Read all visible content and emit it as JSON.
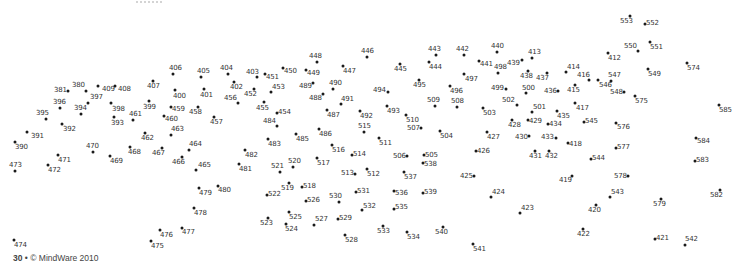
{
  "page": {
    "type": "dot-to-dot puzzle",
    "footer": {
      "page_number": "30",
      "separator": "•",
      "copyright": "© MindWare 2010"
    }
  },
  "style": {
    "dot_color": "#1a1a1a",
    "label_color": "#333333",
    "background": "#ffffff"
  },
  "dots": [
    {
      "n": "381",
      "x": 68,
      "y": 91,
      "lx": -14,
      "ly": -4
    },
    {
      "n": "380",
      "x": 86,
      "y": 91,
      "lx": -14,
      "ly": -9
    },
    {
      "n": "409",
      "x": 98,
      "y": 86,
      "lx": 4,
      "ly": 0
    },
    {
      "n": "408",
      "x": 115,
      "y": 86,
      "lx": 3,
      "ly": 0
    },
    {
      "n": "397",
      "x": 88,
      "y": 103,
      "lx": 2,
      "ly": -9
    },
    {
      "n": "396",
      "x": 60,
      "y": 108,
      "lx": -7,
      "ly": -9
    },
    {
      "n": "394",
      "x": 81,
      "y": 114,
      "lx": -7,
      "ly": -9
    },
    {
      "n": "398",
      "x": 111,
      "y": 103,
      "lx": 1,
      "ly": 3
    },
    {
      "n": "395",
      "x": 46,
      "y": 119,
      "lx": -10,
      "ly": -9
    },
    {
      "n": "392",
      "x": 62,
      "y": 124,
      "lx": 1,
      "ly": 2
    },
    {
      "n": "393",
      "x": 114,
      "y": 117,
      "lx": -3,
      "ly": 3
    },
    {
      "n": "461",
      "x": 133,
      "y": 120,
      "lx": -4,
      "ly": -9
    },
    {
      "n": "391",
      "x": 27,
      "y": 132,
      "lx": 4,
      "ly": 1
    },
    {
      "n": "390",
      "x": 15,
      "y": 142,
      "lx": 0,
      "ly": 2
    },
    {
      "n": "473",
      "x": 15,
      "y": 171,
      "lx": -6,
      "ly": -9
    },
    {
      "n": "471",
      "x": 58,
      "y": 155,
      "lx": 0,
      "ly": 2
    },
    {
      "n": "472",
      "x": 48,
      "y": 165,
      "lx": 0,
      "ly": 2
    },
    {
      "n": "470",
      "x": 93,
      "y": 152,
      "lx": -7,
      "ly": -9
    },
    {
      "n": "469",
      "x": 110,
      "y": 156,
      "lx": 0,
      "ly": 2
    },
    {
      "n": "468",
      "x": 130,
      "y": 147,
      "lx": -2,
      "ly": 2
    },
    {
      "n": "462",
      "x": 145,
      "y": 133,
      "lx": -4,
      "ly": 2
    },
    {
      "n": "463",
      "x": 171,
      "y": 135,
      "lx": 0,
      "ly": -9
    },
    {
      "n": "467",
      "x": 162,
      "y": 148,
      "lx": -10,
      "ly": 2
    },
    {
      "n": "466",
      "x": 182,
      "y": 157,
      "lx": -10,
      "ly": 2
    },
    {
      "n": "464",
      "x": 189,
      "y": 150,
      "lx": 0,
      "ly": -9
    },
    {
      "n": "465",
      "x": 196,
      "y": 170,
      "lx": 2,
      "ly": -8
    },
    {
      "n": "407",
      "x": 153,
      "y": 81,
      "lx": -6,
      "ly": 2
    },
    {
      "n": "406",
      "x": 173,
      "y": 74,
      "lx": -4,
      "ly": -9
    },
    {
      "n": "405",
      "x": 201,
      "y": 77,
      "lx": -4,
      "ly": -9
    },
    {
      "n": "404",
      "x": 228,
      "y": 74,
      "lx": -8,
      "ly": -9
    },
    {
      "n": "400",
      "x": 175,
      "y": 90,
      "lx": -2,
      "ly": 3
    },
    {
      "n": "401",
      "x": 204,
      "y": 89,
      "lx": -4,
      "ly": 3
    },
    {
      "n": "399",
      "x": 149,
      "y": 101,
      "lx": -6,
      "ly": 3
    },
    {
      "n": "459",
      "x": 171,
      "y": 107,
      "lx": 1,
      "ly": -1
    },
    {
      "n": "458",
      "x": 198,
      "y": 107,
      "lx": -9,
      "ly": 2
    },
    {
      "n": "460",
      "x": 164,
      "y": 116,
      "lx": 1,
      "ly": 0
    },
    {
      "n": "457",
      "x": 214,
      "y": 117,
      "lx": -4,
      "ly": 2
    },
    {
      "n": "402",
      "x": 234,
      "y": 82,
      "lx": -4,
      "ly": 2
    },
    {
      "n": "456",
      "x": 238,
      "y": 103,
      "lx": -14,
      "ly": -8
    },
    {
      "n": "403",
      "x": 257,
      "y": 77,
      "lx": -11,
      "ly": -8
    },
    {
      "n": "451",
      "x": 265,
      "y": 74,
      "lx": 1,
      "ly": 0
    },
    {
      "n": "452",
      "x": 254,
      "y": 89,
      "lx": -10,
      "ly": 2
    },
    {
      "n": "453",
      "x": 271,
      "y": 92,
      "lx": 1,
      "ly": -8
    },
    {
      "n": "450",
      "x": 283,
      "y": 68,
      "lx": 1,
      "ly": 0
    },
    {
      "n": "455",
      "x": 264,
      "y": 102,
      "lx": -8,
      "ly": 3
    },
    {
      "n": "454",
      "x": 277,
      "y": 113,
      "lx": 1,
      "ly": -4
    },
    {
      "n": "484",
      "x": 277,
      "y": 126,
      "lx": -14,
      "ly": -8
    },
    {
      "n": "448",
      "x": 317,
      "y": 62,
      "lx": -8,
      "ly": -9
    },
    {
      "n": "449",
      "x": 306,
      "y": 70,
      "lx": 1,
      "ly": 0
    },
    {
      "n": "447",
      "x": 343,
      "y": 66,
      "lx": 0,
      "ly": 2
    },
    {
      "n": "446",
      "x": 367,
      "y": 57,
      "lx": -6,
      "ly": -9
    },
    {
      "n": "490",
      "x": 333,
      "y": 89,
      "lx": -4,
      "ly": -9
    },
    {
      "n": "489",
      "x": 313,
      "y": 83,
      "lx": -14,
      "ly": 0
    },
    {
      "n": "488",
      "x": 323,
      "y": 94,
      "lx": -14,
      "ly": 1
    },
    {
      "n": "491",
      "x": 341,
      "y": 104,
      "lx": 0,
      "ly": -8
    },
    {
      "n": "487",
      "x": 327,
      "y": 110,
      "lx": 0,
      "ly": 2
    },
    {
      "n": "486",
      "x": 319,
      "y": 129,
      "lx": 0,
      "ly": 2
    },
    {
      "n": "485",
      "x": 296,
      "y": 134,
      "lx": 0,
      "ly": 2
    },
    {
      "n": "492",
      "x": 360,
      "y": 111,
      "lx": 0,
      "ly": 2
    },
    {
      "n": "515",
      "x": 364,
      "y": 132,
      "lx": -6,
      "ly": -9
    },
    {
      "n": "483",
      "x": 268,
      "y": 139,
      "lx": 0,
      "ly": 2
    },
    {
      "n": "482",
      "x": 245,
      "y": 150,
      "lx": 0,
      "ly": 2
    },
    {
      "n": "481",
      "x": 239,
      "y": 164,
      "lx": 0,
      "ly": 2
    },
    {
      "n": "516",
      "x": 332,
      "y": 145,
      "lx": 0,
      "ly": 2
    },
    {
      "n": "514",
      "x": 352,
      "y": 155,
      "lx": 1,
      "ly": -4
    },
    {
      "n": "521",
      "x": 280,
      "y": 172,
      "lx": -9,
      "ly": -9
    },
    {
      "n": "520",
      "x": 293,
      "y": 167,
      "lx": -5,
      "ly": -9
    },
    {
      "n": "517",
      "x": 317,
      "y": 158,
      "lx": 0,
      "ly": 2
    },
    {
      "n": "513",
      "x": 355,
      "y": 174,
      "lx": -14,
      "ly": -4
    },
    {
      "n": "512",
      "x": 367,
      "y": 169,
      "lx": 0,
      "ly": 2
    },
    {
      "n": "519",
      "x": 289,
      "y": 183,
      "lx": -8,
      "ly": 2
    },
    {
      "n": "518",
      "x": 302,
      "y": 187,
      "lx": 1,
      "ly": -4
    },
    {
      "n": "522",
      "x": 267,
      "y": 195,
      "lx": 1,
      "ly": -4
    },
    {
      "n": "526",
      "x": 306,
      "y": 201,
      "lx": 1,
      "ly": -4
    },
    {
      "n": "530",
      "x": 339,
      "y": 202,
      "lx": -10,
      "ly": -9
    },
    {
      "n": "531",
      "x": 356,
      "y": 192,
      "lx": 1,
      "ly": -4
    },
    {
      "n": "532",
      "x": 362,
      "y": 210,
      "lx": 1,
      "ly": -7
    },
    {
      "n": "525",
      "x": 289,
      "y": 212,
      "lx": 0,
      "ly": 2
    },
    {
      "n": "523",
      "x": 268,
      "y": 218,
      "lx": -8,
      "ly": 2
    },
    {
      "n": "524",
      "x": 286,
      "y": 224,
      "lx": -1,
      "ly": 2
    },
    {
      "n": "527",
      "x": 314,
      "y": 225,
      "lx": 1,
      "ly": -9
    },
    {
      "n": "529",
      "x": 338,
      "y": 219,
      "lx": 1,
      "ly": -4
    },
    {
      "n": "528",
      "x": 345,
      "y": 235,
      "lx": 0,
      "ly": 2
    },
    {
      "n": "480",
      "x": 218,
      "y": 186,
      "lx": 0,
      "ly": 1
    },
    {
      "n": "479",
      "x": 199,
      "y": 188,
      "lx": 0,
      "ly": 2
    },
    {
      "n": "478",
      "x": 194,
      "y": 208,
      "lx": 0,
      "ly": 2
    },
    {
      "n": "477",
      "x": 182,
      "y": 228,
      "lx": 0,
      "ly": 1
    },
    {
      "n": "476",
      "x": 160,
      "y": 230,
      "lx": 0,
      "ly": 2
    },
    {
      "n": "475",
      "x": 151,
      "y": 241,
      "lx": 0,
      "ly": 2
    },
    {
      "n": "474",
      "x": 14,
      "y": 240,
      "lx": 0,
      "ly": 2
    },
    {
      "n": "445",
      "x": 400,
      "y": 64,
      "lx": -6,
      "ly": 2
    },
    {
      "n": "443",
      "x": 436,
      "y": 55,
      "lx": -8,
      "ly": -9
    },
    {
      "n": "444",
      "x": 429,
      "y": 62,
      "lx": 0,
      "ly": 2
    },
    {
      "n": "442",
      "x": 464,
      "y": 55,
      "lx": -8,
      "ly": -9
    },
    {
      "n": "441",
      "x": 479,
      "y": 61,
      "lx": 1,
      "ly": 0
    },
    {
      "n": "440",
      "x": 497,
      "y": 52,
      "lx": -6,
      "ly": -9
    },
    {
      "n": "497",
      "x": 464,
      "y": 74,
      "lx": 1,
      "ly": 2
    },
    {
      "n": "498",
      "x": 498,
      "y": 73,
      "lx": -4,
      "ly": -9
    },
    {
      "n": "439",
      "x": 522,
      "y": 60,
      "lx": -15,
      "ly": 0
    },
    {
      "n": "413",
      "x": 532,
      "y": 58,
      "lx": -4,
      "ly": -9
    },
    {
      "n": "494",
      "x": 388,
      "y": 92,
      "lx": -15,
      "ly": -5
    },
    {
      "n": "495",
      "x": 419,
      "y": 80,
      "lx": -6,
      "ly": 2
    },
    {
      "n": "496",
      "x": 450,
      "y": 86,
      "lx": 0,
      "ly": 2
    },
    {
      "n": "438",
      "x": 528,
      "y": 71,
      "lx": -8,
      "ly": 2
    },
    {
      "n": "437",
      "x": 547,
      "y": 73,
      "lx": -11,
      "ly": 2
    },
    {
      "n": "499",
      "x": 506,
      "y": 89,
      "lx": -15,
      "ly": -4
    },
    {
      "n": "500",
      "x": 526,
      "y": 93,
      "lx": -4,
      "ly": -8
    },
    {
      "n": "436",
      "x": 558,
      "y": 91,
      "lx": -14,
      "ly": -3
    },
    {
      "n": "493",
      "x": 387,
      "y": 106,
      "lx": 0,
      "ly": 2
    },
    {
      "n": "509",
      "x": 435,
      "y": 106,
      "lx": -8,
      "ly": -9
    },
    {
      "n": "508",
      "x": 457,
      "y": 107,
      "lx": -6,
      "ly": -9
    },
    {
      "n": "503",
      "x": 483,
      "y": 108,
      "lx": 0,
      "ly": 2
    },
    {
      "n": "502",
      "x": 517,
      "y": 105,
      "lx": -15,
      "ly": -8
    },
    {
      "n": "510",
      "x": 406,
      "y": 115,
      "lx": 0,
      "ly": 2
    },
    {
      "n": "501",
      "x": 532,
      "y": 112,
      "lx": 1,
      "ly": -8
    },
    {
      "n": "435",
      "x": 557,
      "y": 111,
      "lx": 0,
      "ly": 2
    },
    {
      "n": "507",
      "x": 421,
      "y": 128,
      "lx": -14,
      "ly": -3
    },
    {
      "n": "504",
      "x": 440,
      "y": 131,
      "lx": 0,
      "ly": 2
    },
    {
      "n": "511",
      "x": 379,
      "y": 138,
      "lx": 0,
      "ly": 2
    },
    {
      "n": "428",
      "x": 512,
      "y": 120,
      "lx": -4,
      "ly": 2
    },
    {
      "n": "429",
      "x": 528,
      "y": 120,
      "lx": 1,
      "ly": -2
    },
    {
      "n": "434",
      "x": 548,
      "y": 124,
      "lx": 1,
      "ly": -3
    },
    {
      "n": "427",
      "x": 487,
      "y": 132,
      "lx": 0,
      "ly": 2
    },
    {
      "n": "430",
      "x": 529,
      "y": 136,
      "lx": -14,
      "ly": -2
    },
    {
      "n": "433",
      "x": 556,
      "y": 138,
      "lx": -15,
      "ly": -4
    },
    {
      "n": "418",
      "x": 568,
      "y": 143,
      "lx": 1,
      "ly": -2
    },
    {
      "n": "426",
      "x": 476,
      "y": 151,
      "lx": 1,
      "ly": -3
    },
    {
      "n": "431",
      "x": 535,
      "y": 151,
      "lx": -6,
      "ly": 2
    },
    {
      "n": "432",
      "x": 549,
      "y": 151,
      "lx": -4,
      "ly": 2
    },
    {
      "n": "506",
      "x": 407,
      "y": 156,
      "lx": -14,
      "ly": -3
    },
    {
      "n": "505",
      "x": 424,
      "y": 155,
      "lx": 1,
      "ly": -3
    },
    {
      "n": "538",
      "x": 423,
      "y": 163,
      "lx": 1,
      "ly": -2
    },
    {
      "n": "537",
      "x": 404,
      "y": 172,
      "lx": 0,
      "ly": 2
    },
    {
      "n": "425",
      "x": 474,
      "y": 176,
      "lx": -14,
      "ly": -3
    },
    {
      "n": "536",
      "x": 394,
      "y": 191,
      "lx": 1,
      "ly": -1
    },
    {
      "n": "539",
      "x": 423,
      "y": 193,
      "lx": 1,
      "ly": -4
    },
    {
      "n": "424",
      "x": 491,
      "y": 197,
      "lx": 1,
      "ly": -8
    },
    {
      "n": "535",
      "x": 394,
      "y": 209,
      "lx": 1,
      "ly": -5
    },
    {
      "n": "423",
      "x": 520,
      "y": 213,
      "lx": 1,
      "ly": -8
    },
    {
      "n": "533",
      "x": 383,
      "y": 226,
      "lx": -6,
      "ly": 2
    },
    {
      "n": "534",
      "x": 407,
      "y": 232,
      "lx": 0,
      "ly": 2
    },
    {
      "n": "540",
      "x": 443,
      "y": 227,
      "lx": -8,
      "ly": 2
    },
    {
      "n": "541",
      "x": 473,
      "y": 244,
      "lx": 0,
      "ly": 2
    },
    {
      "n": "553",
      "x": 630,
      "y": 16,
      "lx": -10,
      "ly": 2
    },
    {
      "n": "552",
      "x": 645,
      "y": 24,
      "lx": 1,
      "ly": -4
    },
    {
      "n": "550",
      "x": 638,
      "y": 51,
      "lx": -14,
      "ly": -8
    },
    {
      "n": "551",
      "x": 650,
      "y": 42,
      "lx": 0,
      "ly": 2
    },
    {
      "n": "412",
      "x": 608,
      "y": 53,
      "lx": 0,
      "ly": 2
    },
    {
      "n": "574",
      "x": 687,
      "y": 63,
      "lx": 0,
      "ly": 2
    },
    {
      "n": "549",
      "x": 648,
      "y": 69,
      "lx": 0,
      "ly": 2
    },
    {
      "n": "414",
      "x": 566,
      "y": 72,
      "lx": 1,
      "ly": -8
    },
    {
      "n": "416",
      "x": 589,
      "y": 80,
      "lx": -12,
      "ly": -8
    },
    {
      "n": "546",
      "x": 598,
      "y": 80,
      "lx": 1,
      "ly": 2
    },
    {
      "n": "547",
      "x": 611,
      "y": 81,
      "lx": -3,
      "ly": -9
    },
    {
      "n": "415",
      "x": 575,
      "y": 85,
      "lx": -8,
      "ly": 2
    },
    {
      "n": "548",
      "x": 624,
      "y": 92,
      "lx": -14,
      "ly": -3
    },
    {
      "n": "575",
      "x": 635,
      "y": 96,
      "lx": 0,
      "ly": 2
    },
    {
      "n": "417",
      "x": 575,
      "y": 103,
      "lx": 1,
      "ly": 2
    },
    {
      "n": "585",
      "x": 719,
      "y": 105,
      "lx": 0,
      "ly": 2
    },
    {
      "n": "545",
      "x": 584,
      "y": 122,
      "lx": 1,
      "ly": -4
    },
    {
      "n": "576",
      "x": 616,
      "y": 123,
      "lx": 1,
      "ly": 1
    },
    {
      "n": "584",
      "x": 696,
      "y": 138,
      "lx": 1,
      "ly": 0
    },
    {
      "n": "577",
      "x": 616,
      "y": 148,
      "lx": 1,
      "ly": -4
    },
    {
      "n": "544",
      "x": 591,
      "y": 159,
      "lx": 1,
      "ly": -4
    },
    {
      "n": "583",
      "x": 695,
      "y": 161,
      "lx": 1,
      "ly": -4
    },
    {
      "n": "419",
      "x": 572,
      "y": 176,
      "lx": -13,
      "ly": 1
    },
    {
      "n": "578",
      "x": 628,
      "y": 176,
      "lx": -14,
      "ly": -3
    },
    {
      "n": "543",
      "x": 610,
      "y": 197,
      "lx": 1,
      "ly": -8
    },
    {
      "n": "582",
      "x": 720,
      "y": 190,
      "lx": -10,
      "ly": 2
    },
    {
      "n": "579",
      "x": 661,
      "y": 199,
      "lx": -8,
      "ly": 2
    },
    {
      "n": "420",
      "x": 596,
      "y": 205,
      "lx": -8,
      "ly": 2
    },
    {
      "n": "422",
      "x": 583,
      "y": 229,
      "lx": -6,
      "ly": 2
    },
    {
      "n": "421",
      "x": 655,
      "y": 239,
      "lx": 1,
      "ly": -4
    },
    {
      "n": "542",
      "x": 685,
      "y": 245,
      "lx": 0,
      "ly": -9
    }
  ]
}
